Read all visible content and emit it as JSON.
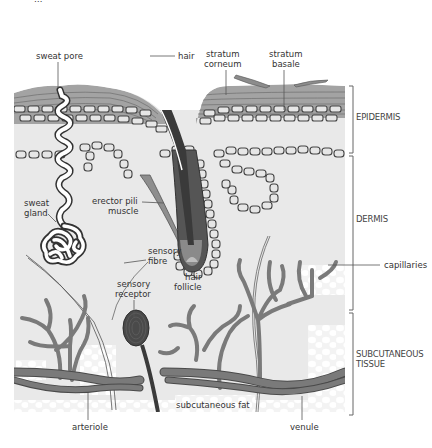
{
  "figure": {
    "title_clipped": "Layers of the skin",
    "colors": {
      "background": "#ffffff",
      "tissue": "#e8e8e8",
      "stratum": "#9a9a9a",
      "stratum_line": "#6a6a6a",
      "cell_fill": "#e6e6e6",
      "cell_stroke": "#444444",
      "hair": "#3a3a3a",
      "vessel": "#7a7a7a",
      "muscle": "#8a8a8a",
      "label_text": "#333333"
    }
  },
  "labels": {
    "sweat_pore": "sweat pore",
    "hair": "hair",
    "stratum_corneum_1": "stratum",
    "stratum_corneum_2": "corneum",
    "stratum_basale_1": "stratum",
    "stratum_basale_2": "basale",
    "sweat_gland_1": "sweat",
    "sweat_gland_2": "gland",
    "erector_pili_1": "erector pili",
    "erector_pili_2": "muscle",
    "sensory_fibre_1": "sensory",
    "sensory_fibre_2": "fibre",
    "sensory_receptor_1": "sensory",
    "sensory_receptor_2": "receptor",
    "hair_follicle_1": "hair",
    "hair_follicle_2": "follicle",
    "capillaries": "capillaries",
    "subcutaneous_fat": "subcutaneous fat",
    "arteriole": "arteriole",
    "venule": "venule"
  },
  "layers": [
    {
      "name": "EPIDERMIS",
      "line1": "EPIDERMIS",
      "line2": ""
    },
    {
      "name": "DERMIS",
      "line1": "DERMIS",
      "line2": ""
    },
    {
      "name": "SUBCUTANEOUS TISSUE",
      "line1": "SUBCUTANEOUS",
      "line2": "TISSUE"
    }
  ]
}
